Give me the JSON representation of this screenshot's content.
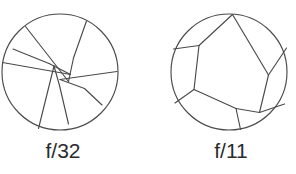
{
  "figure": {
    "background_color": "#ffffff",
    "stroke_color": "#4a4a4a",
    "text_color": "#2b2b2b",
    "apertures": [
      {
        "id": "aperture-left",
        "label": "f/32",
        "description": "Diaphragm closed down to a small opening",
        "blade_count": 6,
        "opening_size": "small",
        "circle": {
          "cx": 60,
          "cy": 72,
          "r": 58
        }
      },
      {
        "id": "aperture-right",
        "label": "f/11",
        "description": "Diaphragm opened to a wide hexagonal opening",
        "blade_count": 6,
        "opening_size": "large",
        "circle": {
          "cx": 69,
          "cy": 72,
          "r": 58
        }
      }
    ]
  }
}
